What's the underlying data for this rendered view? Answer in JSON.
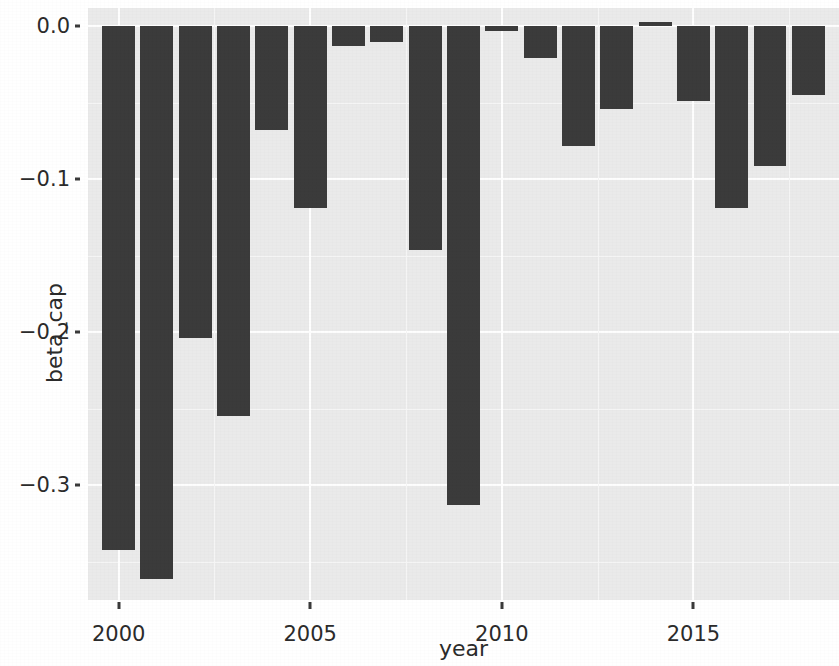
{
  "chart_data": {
    "type": "bar",
    "title": "",
    "xlabel": "year",
    "ylabel": "beta_cap",
    "categories": [
      2000,
      2001,
      2002,
      2003,
      2004,
      2005,
      2006,
      2007,
      2008,
      2009,
      2010,
      2011,
      2012,
      2013,
      2014,
      2015,
      2016,
      2017,
      2018
    ],
    "values": [
      -0.342,
      -0.361,
      -0.204,
      -0.255,
      -0.068,
      -0.119,
      -0.013,
      -0.01,
      -0.146,
      -0.313,
      -0.003,
      -0.021,
      -0.078,
      -0.054,
      0.003,
      -0.049,
      -0.119,
      -0.091,
      -0.045
    ],
    "xlim": [
      1999.2,
      2018.8
    ],
    "ylim": [
      -0.375,
      0.012
    ],
    "x_ticks": [
      2000,
      2005,
      2010,
      2015
    ],
    "x_tick_labels": [
      "2000",
      "2005",
      "2010",
      "2015"
    ],
    "y_ticks": [
      0.0,
      -0.1,
      -0.2,
      -0.3
    ],
    "y_tick_labels": [
      "0.0",
      "−0.1",
      "−0.2",
      "−0.3"
    ],
    "grid": true,
    "legend": "none",
    "bar_color": "#3b3b3b",
    "panel_color": "#eaeaea",
    "gridline_color": "#fefefe"
  },
  "axes": {
    "y_title": "beta_cap",
    "x_title": "year"
  },
  "bleed_text": {
    "lines": [
      "各类企业的生产率水平与技术创新",
      "的三个主要特征之一是",
      "考察了其中的关系，发现在样本内",
      "（2011）的研究结果相一致，表明了",
      "与张文涛（Zhang等，2015）的研究相比",
      "在此基础上进一步控制了地区差异，并得到了",
      "的证据。",
      "此外，本文还考虑了行业异质性对估计结果",
      "影响了企业投资效率，与前文结论一致。",
      "分析了十年期间的数据，结果稳健。"
    ],
    "y_positions": [
      18,
      72,
      126,
      180,
      234,
      288,
      342,
      396,
      450,
      504
    ]
  }
}
